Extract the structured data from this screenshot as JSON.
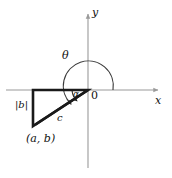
{
  "figure": {
    "type": "math-diagram",
    "background_color": "#ffffff",
    "axis_color": "#9a9a9a",
    "arc_color": "#3a3a3a",
    "triangle_color": "#1a1a1a",
    "label_color": "#111111",
    "axes": {
      "x_label": "x",
      "y_label": "y",
      "origin_label": "0"
    },
    "angles": [
      {
        "name": "theta-angle-label",
        "label": "θ"
      },
      {
        "name": "alpha-angle-label",
        "label": "α"
      }
    ],
    "sides": [
      {
        "name": "opposite-side-label",
        "label": "|b|"
      },
      {
        "name": "hypotenuse-label",
        "label": "c"
      }
    ],
    "points": [
      {
        "name": "point-ab-label",
        "label": "(a, b)"
      }
    ]
  }
}
